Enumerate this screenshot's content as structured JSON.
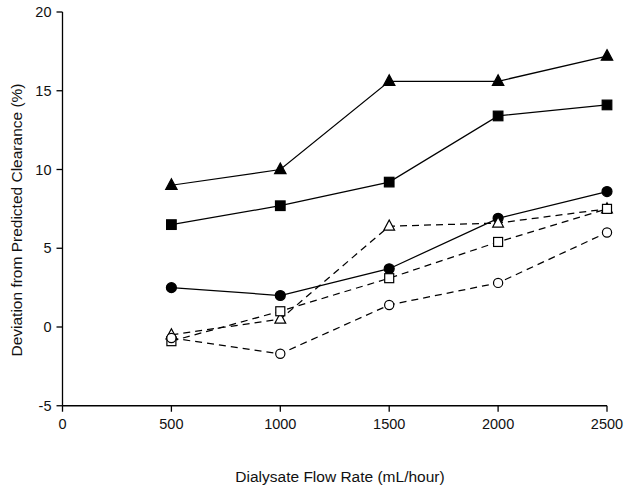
{
  "chart_data": {
    "type": "line",
    "title": "",
    "xlabel": "Dialysate Flow Rate (mL/hour)",
    "ylabel": "Deviation from Predicted Clearance (%)",
    "x": [
      500,
      1000,
      1500,
      2000,
      2500
    ],
    "xlim": [
      0,
      2500
    ],
    "ylim": [
      -5,
      20
    ],
    "xticks": [
      0,
      500,
      1000,
      1500,
      2000,
      2500
    ],
    "yticks": [
      -5,
      0,
      5,
      10,
      15,
      20
    ],
    "xtick_labels": [
      "0",
      "500",
      "1000",
      "1500",
      "2000",
      "2500"
    ],
    "ytick_labels": [
      "-5",
      "0",
      "5",
      "10",
      "15",
      "20"
    ],
    "grid": false,
    "legend": "none",
    "series": [
      {
        "name": "filled-triangle",
        "marker": "triangle",
        "fill": "solid",
        "line": "solid",
        "color": "#000000",
        "values": [
          9.0,
          10.0,
          15.6,
          15.6,
          17.2
        ]
      },
      {
        "name": "filled-square",
        "marker": "square",
        "fill": "solid",
        "line": "solid",
        "color": "#000000",
        "values": [
          6.5,
          7.7,
          9.2,
          13.4,
          14.1
        ]
      },
      {
        "name": "filled-circle",
        "marker": "circle",
        "fill": "solid",
        "line": "solid",
        "color": "#000000",
        "values": [
          2.5,
          2.0,
          3.7,
          6.9,
          8.6
        ]
      },
      {
        "name": "open-triangle",
        "marker": "triangle",
        "fill": "open",
        "line": "dashed",
        "color": "#000000",
        "values": [
          -0.5,
          0.5,
          6.4,
          6.6,
          7.5
        ]
      },
      {
        "name": "open-square",
        "marker": "square",
        "fill": "open",
        "line": "dashed",
        "color": "#000000",
        "values": [
          -0.9,
          1.0,
          3.1,
          5.4,
          7.5
        ]
      },
      {
        "name": "open-circle",
        "marker": "circle",
        "fill": "open",
        "line": "dashed",
        "color": "#000000",
        "values": [
          -0.7,
          -1.7,
          1.4,
          2.8,
          6.0
        ]
      }
    ]
  },
  "axes": {
    "x_title": "Dialysate Flow Rate (mL/hour)",
    "y_title": "Deviation from Predicted Clearance (%)"
  },
  "colors": {
    "ink": "#000000",
    "background": "#ffffff"
  }
}
